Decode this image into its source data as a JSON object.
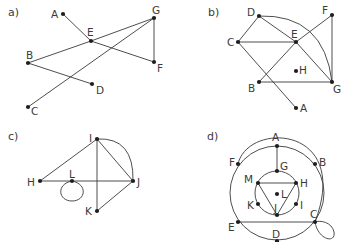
{
  "panels": [
    {
      "id": "a",
      "label": "a)",
      "label_pos": [
        8,
        16
      ],
      "nodes": [
        {
          "name": "A",
          "x": 63,
          "y": 14,
          "lx": 51,
          "ly": 18
        },
        {
          "name": "E",
          "x": 91,
          "y": 41,
          "lx": 87,
          "ly": 36
        },
        {
          "name": "G",
          "x": 154,
          "y": 18,
          "lx": 152,
          "ly": 14
        },
        {
          "name": "F",
          "x": 154,
          "y": 62,
          "lx": 157,
          "ly": 72
        },
        {
          "name": "B",
          "x": 28,
          "y": 63,
          "lx": 26,
          "ly": 59
        },
        {
          "name": "D",
          "x": 92,
          "y": 84,
          "lx": 96,
          "ly": 94
        },
        {
          "name": "C",
          "x": 28,
          "y": 107,
          "lx": 31,
          "ly": 115
        }
      ],
      "edges": [
        [
          "A",
          "E"
        ],
        [
          "E",
          "F"
        ],
        [
          "E",
          "G"
        ],
        [
          "B",
          "E"
        ],
        [
          "G",
          "F"
        ],
        [
          "B",
          "D"
        ],
        [
          "C",
          "G"
        ]
      ],
      "curves": [],
      "loops": []
    },
    {
      "id": "b",
      "label": "b)",
      "label_pos": [
        208,
        16
      ],
      "nodes": [
        {
          "name": "D",
          "x": 259,
          "y": 16,
          "lx": 247,
          "ly": 16
        },
        {
          "name": "F",
          "x": 332,
          "y": 15,
          "lx": 322,
          "ly": 14
        },
        {
          "name": "C",
          "x": 238,
          "y": 42,
          "lx": 227,
          "ly": 46
        },
        {
          "name": "E",
          "x": 296,
          "y": 42,
          "lx": 291,
          "ly": 38
        },
        {
          "name": "H",
          "x": 296,
          "y": 71,
          "lx": 299,
          "ly": 74
        },
        {
          "name": "B",
          "x": 259,
          "y": 82,
          "lx": 248,
          "ly": 92
        },
        {
          "name": "G",
          "x": 332,
          "y": 82,
          "lx": 333,
          "ly": 93
        },
        {
          "name": "A",
          "x": 296,
          "y": 108,
          "lx": 300,
          "ly": 112
        }
      ],
      "edges": [
        [
          "C",
          "D"
        ],
        [
          "D",
          "E"
        ],
        [
          "C",
          "E"
        ],
        [
          "E",
          "F"
        ],
        [
          "E",
          "G"
        ],
        [
          "F",
          "G"
        ],
        [
          "B",
          "E"
        ],
        [
          "B",
          "G"
        ],
        [
          "C",
          "A"
        ]
      ],
      "curves": [
        {
          "from": "D",
          "to": "G",
          "path": "M259,16 Q324,14 332,82"
        }
      ],
      "loops": []
    },
    {
      "id": "c",
      "label": "c)",
      "label_pos": [
        8,
        140
      ],
      "nodes": [
        {
          "name": "I",
          "x": 97,
          "y": 139,
          "lx": 89,
          "ly": 142
        },
        {
          "name": "H",
          "x": 40,
          "y": 181,
          "lx": 27,
          "ly": 186
        },
        {
          "name": "L",
          "x": 72,
          "y": 181,
          "lx": 69,
          "ly": 178
        },
        {
          "name": "J",
          "x": 133,
          "y": 181,
          "lx": 137,
          "ly": 186
        },
        {
          "name": "K",
          "x": 97,
          "y": 211,
          "lx": 85,
          "ly": 215
        }
      ],
      "edges": [
        [
          "I",
          "H"
        ],
        [
          "H",
          "J"
        ],
        [
          "I",
          "J"
        ],
        [
          "I",
          "K"
        ],
        [
          "K",
          "J"
        ]
      ],
      "curves": [
        {
          "from": "I",
          "to": "J",
          "path": "M97,139 Q134,137 133,181"
        }
      ],
      "loops": [
        {
          "at": "L",
          "path": "M72,181 C56,184 58,201 72,201 C86,201 88,184 72,181"
        }
      ]
    },
    {
      "id": "d",
      "label": "d)",
      "label_pos": [
        207,
        140
      ],
      "nodes": [
        {
          "name": "A",
          "x": 277,
          "y": 146,
          "lx": 272,
          "ly": 141
        },
        {
          "name": "F",
          "x": 238,
          "y": 164,
          "lx": 229,
          "ly": 166
        },
        {
          "name": "B",
          "x": 315,
          "y": 164,
          "lx": 319,
          "ly": 166
        },
        {
          "name": "G",
          "x": 277,
          "y": 171,
          "lx": 280,
          "ly": 170
        },
        {
          "name": "M",
          "x": 258,
          "y": 183,
          "lx": 244,
          "ly": 183
        },
        {
          "name": "H",
          "x": 296,
          "y": 183,
          "lx": 300,
          "ly": 187
        },
        {
          "name": "L",
          "x": 277,
          "y": 194,
          "lx": 281,
          "ly": 198
        },
        {
          "name": "K",
          "x": 258,
          "y": 204,
          "lx": 247,
          "ly": 209
        },
        {
          "name": "I",
          "x": 296,
          "y": 204,
          "lx": 300,
          "ly": 209
        },
        {
          "name": "J",
          "x": 277,
          "y": 215,
          "lx": 0,
          "ly": 0
        },
        {
          "name": "E",
          "x": 238,
          "y": 222,
          "lx": 228,
          "ly": 231
        },
        {
          "name": "C",
          "x": 315,
          "y": 222,
          "lx": 310,
          "ly": 218
        },
        {
          "name": "D",
          "x": 277,
          "y": 241,
          "lx": 272,
          "ly": 238
        }
      ],
      "edges": [
        [
          "A",
          "G"
        ],
        [
          "M",
          "H"
        ],
        [
          "M",
          "J"
        ],
        [
          "H",
          "J"
        ],
        [
          "E",
          "C"
        ]
      ],
      "curves": [
        {
          "from": "F",
          "to": "C",
          "path": "M238,164 C248,121 352,125 315,222"
        }
      ],
      "circles": [
        {
          "cx": 277,
          "cy": 193,
          "r": 47
        },
        {
          "cx": 277,
          "cy": 193,
          "r": 22
        }
      ],
      "loops": [
        {
          "at": "C",
          "path": "M315,222 C318,240 336,244 334,232 C332,222 320,220 315,222"
        }
      ]
    }
  ]
}
